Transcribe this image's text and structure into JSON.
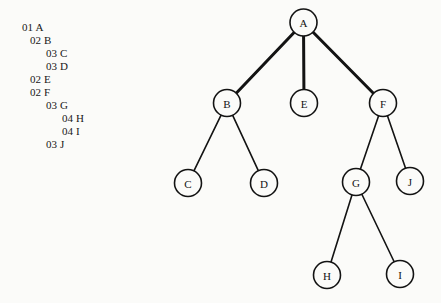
{
  "diagram": {
    "background_color": "#fbfbf9",
    "ink_color": "#131313"
  },
  "level_list": {
    "name": "level-number-outline",
    "items": [
      {
        "level": "01",
        "name": "A",
        "indent": 0,
        "x": 22,
        "y": 22
      },
      {
        "level": "02",
        "name": "B",
        "indent": 1,
        "x": 30,
        "y": 35
      },
      {
        "level": "03",
        "name": "C",
        "indent": 2,
        "x": 46,
        "y": 48
      },
      {
        "level": "03",
        "name": "D",
        "indent": 2,
        "x": 46,
        "y": 61
      },
      {
        "level": "02",
        "name": "E",
        "indent": 1,
        "x": 30,
        "y": 74
      },
      {
        "level": "02",
        "name": "F",
        "indent": 1,
        "x": 30,
        "y": 87
      },
      {
        "level": "03",
        "name": "G",
        "indent": 2,
        "x": 46,
        "y": 100
      },
      {
        "level": "04",
        "name": "H",
        "indent": 3,
        "x": 62,
        "y": 113
      },
      {
        "level": "04",
        "name": "I",
        "indent": 3,
        "x": 62,
        "y": 126
      },
      {
        "level": "03",
        "name": "J",
        "indent": 2,
        "x": 46,
        "y": 139
      }
    ]
  },
  "tree": {
    "name": "tree-diagram",
    "node_radius": 13.5,
    "nodes": [
      {
        "id": "A",
        "label": "A",
        "cx": 303.5,
        "cy": 22.5
      },
      {
        "id": "B",
        "label": "B",
        "cx": 227,
        "cy": 103
      },
      {
        "id": "E",
        "label": "E",
        "cx": 304,
        "cy": 103
      },
      {
        "id": "F",
        "label": "F",
        "cx": 383,
        "cy": 103
      },
      {
        "id": "C",
        "label": "C",
        "cx": 188,
        "cy": 183
      },
      {
        "id": "D",
        "label": "D",
        "cx": 264,
        "cy": 183
      },
      {
        "id": "G",
        "label": "G",
        "cx": 356,
        "cy": 182
      },
      {
        "id": "J",
        "label": "J",
        "cx": 410,
        "cy": 181
      },
      {
        "id": "H",
        "label": "H",
        "cx": 327,
        "cy": 275
      },
      {
        "id": "I",
        "label": "I",
        "cx": 400,
        "cy": 274
      }
    ],
    "edges": [
      {
        "from": "A",
        "to": "B",
        "width": 3.0
      },
      {
        "from": "A",
        "to": "E",
        "width": 3.0
      },
      {
        "from": "A",
        "to": "F",
        "width": 3.0
      },
      {
        "from": "B",
        "to": "C",
        "width": 1.6
      },
      {
        "from": "B",
        "to": "D",
        "width": 1.6
      },
      {
        "from": "F",
        "to": "G",
        "width": 1.6
      },
      {
        "from": "F",
        "to": "J",
        "width": 1.6
      },
      {
        "from": "G",
        "to": "H",
        "width": 1.6
      },
      {
        "from": "G",
        "to": "I",
        "width": 1.6
      }
    ]
  }
}
